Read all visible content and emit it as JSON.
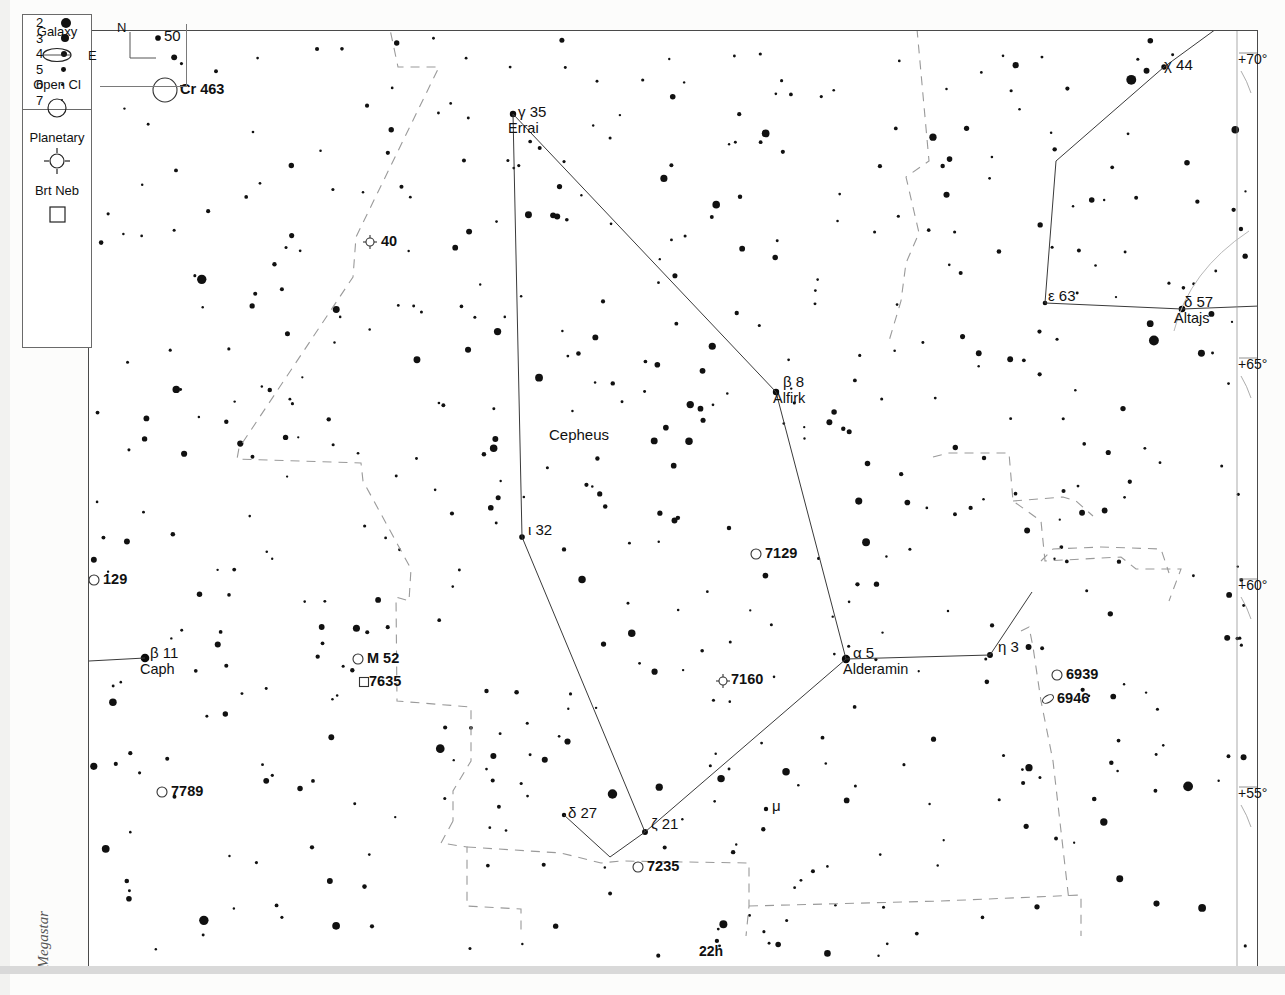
{
  "meta": {
    "watermark": "Megastar",
    "constellation_label": "Cepheus"
  },
  "legend": {
    "magnitude_title": "magnitudes",
    "magnitudes": [
      {
        "mag": "2",
        "r": 5.0
      },
      {
        "mag": "3",
        "r": 4.2
      },
      {
        "mag": "4",
        "r": 3.2
      },
      {
        "mag": "5",
        "r": 2.4
      },
      {
        "mag": "6",
        "r": 1.7
      },
      {
        "mag": "7",
        "r": 1.2
      }
    ],
    "symbols": [
      {
        "label": "Galaxy",
        "icon": "galaxy-ellipse-icon"
      },
      {
        "label": "Open Cl",
        "icon": "open-cluster-circle-icon"
      },
      {
        "label": "Planetary",
        "icon": "planetary-nebula-icon"
      },
      {
        "label": "Brt Neb",
        "icon": "bright-nebula-square-icon"
      }
    ]
  },
  "compass": {
    "north": "N",
    "east": "E"
  },
  "axes": {
    "declination": [
      {
        "label": "+70°",
        "x": 1238,
        "y": 52
      },
      {
        "label": "+65°",
        "x": 1238,
        "y": 357
      },
      {
        "label": "+60°",
        "x": 1238,
        "y": 578
      },
      {
        "label": "+55°",
        "x": 1238,
        "y": 786
      }
    ],
    "right_ascension": [
      {
        "label": "22h",
        "x": 699,
        "y": 944
      }
    ]
  },
  "star_labels": [
    {
      "name": "50",
      "greek": "",
      "num": "50",
      "proper": "",
      "x": 164,
      "y": 28,
      "anchor": "left"
    },
    {
      "name": "gamma-35",
      "greek": "γ",
      "num": "35",
      "proper": "Errai",
      "x": 518,
      "y": 104,
      "anchor": "left"
    },
    {
      "name": "chi-44",
      "greek": "χ",
      "num": "44",
      "proper": "",
      "x": 1164,
      "y": 57,
      "anchor": "left"
    },
    {
      "name": "epsilon-63",
      "greek": "ε",
      "num": "63",
      "proper": "",
      "x": 1048,
      "y": 288,
      "anchor": "left"
    },
    {
      "name": "delta-57",
      "greek": "δ",
      "num": "57",
      "proper": "Altajs",
      "x": 1184,
      "y": 294,
      "anchor": "left"
    },
    {
      "name": "beta-8",
      "greek": "β",
      "num": "8",
      "proper": "Alfirk",
      "x": 783,
      "y": 374,
      "anchor": "left"
    },
    {
      "name": "iota-32",
      "greek": "ι",
      "num": "32",
      "proper": "",
      "x": 528,
      "y": 522,
      "anchor": "left"
    },
    {
      "name": "beta-11",
      "greek": "β",
      "num": "11",
      "proper": "Caph",
      "x": 150,
      "y": 645,
      "anchor": "left"
    },
    {
      "name": "alpha-5",
      "greek": "α",
      "num": "5",
      "proper": "Alderamin",
      "x": 853,
      "y": 645,
      "anchor": "left"
    },
    {
      "name": "eta-3",
      "greek": "η",
      "num": "3",
      "proper": "",
      "x": 998,
      "y": 639,
      "anchor": "left"
    },
    {
      "name": "delta-27",
      "greek": "δ",
      "num": "27",
      "proper": "",
      "x": 568,
      "y": 805,
      "anchor": "left"
    },
    {
      "name": "zeta-21",
      "greek": "ζ",
      "num": "21",
      "proper": "",
      "x": 651,
      "y": 816,
      "anchor": "left"
    },
    {
      "name": "mu",
      "greek": "μ",
      "num": "",
      "proper": "",
      "x": 772,
      "y": 798,
      "anchor": "left"
    }
  ],
  "deep_sky": [
    {
      "name": "Cr 463",
      "type": "open-cluster",
      "x": 164,
      "y": 89,
      "lx": 180,
      "ly": 82
    },
    {
      "name": "40",
      "type": "planetary",
      "x": 369,
      "y": 241,
      "lx": 381,
      "ly": 234
    },
    {
      "name": "7129",
      "type": "open-cluster",
      "x": 755,
      "y": 553,
      "lx": 765,
      "ly": 546
    },
    {
      "name": "129",
      "type": "open-cluster",
      "x": 93,
      "y": 579,
      "lx": 103,
      "ly": 572
    },
    {
      "name": "M 52",
      "type": "open-cluster",
      "x": 357,
      "y": 658,
      "lx": 367,
      "ly": 651
    },
    {
      "name": "7635",
      "type": "bright-neb",
      "x": 363,
      "y": 681,
      "lx": 369,
      "ly": 674
    },
    {
      "name": "7160",
      "type": "planetary",
      "x": 722,
      "y": 680,
      "lx": 731,
      "ly": 672
    },
    {
      "name": "6939",
      "type": "open-cluster",
      "x": 1056,
      "y": 674,
      "lx": 1066,
      "ly": 667
    },
    {
      "name": "6946",
      "type": "galaxy",
      "x": 1047,
      "y": 698,
      "lx": 1057,
      "ly": 691
    },
    {
      "name": "7789",
      "type": "open-cluster",
      "x": 161,
      "y": 791,
      "lx": 171,
      "ly": 784
    },
    {
      "name": "7235",
      "type": "open-cluster",
      "x": 637,
      "y": 866,
      "lx": 647,
      "ly": 859
    }
  ],
  "chart_data": {
    "type": "scatter",
    "xlabel": "Right Ascension",
    "ylabel": "Declination",
    "projection": "equatorial",
    "grid": true,
    "legend_position": "left",
    "magnitude_scale": [
      2,
      3,
      4,
      5,
      6,
      7
    ],
    "named_stars": [
      {
        "id": "gamma-35",
        "bayer": "γ",
        "flamsteed": 35,
        "proper": "Errai",
        "px": 512,
        "py": 113,
        "mag": 3.2
      },
      {
        "id": "beta-8",
        "bayer": "β",
        "flamsteed": 8,
        "proper": "Alfirk",
        "px": 775,
        "py": 391,
        "mag": 3.2
      },
      {
        "id": "alpha-5",
        "bayer": "α",
        "flamsteed": 5,
        "proper": "Alderamin",
        "px": 845,
        "py": 658,
        "mag": 2.4
      },
      {
        "id": "eta-3",
        "bayer": "η",
        "flamsteed": 3,
        "proper": "",
        "px": 989,
        "py": 654,
        "mag": 3.4
      },
      {
        "id": "iota-32",
        "bayer": "ι",
        "flamsteed": 32,
        "proper": "",
        "px": 521,
        "py": 536,
        "mag": 3.5
      },
      {
        "id": "zeta-21",
        "bayer": "ζ",
        "flamsteed": 21,
        "proper": "",
        "px": 644,
        "py": 831,
        "mag": 3.4
      },
      {
        "id": "delta-27",
        "bayer": "δ",
        "flamsteed": 27,
        "proper": "",
        "px": 563,
        "py": 814,
        "mag": 4.0
      },
      {
        "id": "mu",
        "bayer": "μ",
        "flamsteed": 0,
        "proper": "",
        "px": 765,
        "py": 808,
        "mag": 4.1
      },
      {
        "id": "epsilon-63",
        "bayer": "ε",
        "flamsteed": 63,
        "proper": "",
        "px": 1044,
        "py": 302,
        "mag": 3.9
      },
      {
        "id": "delta-57",
        "bayer": "δ",
        "flamsteed": 57,
        "proper": "Altajs",
        "px": 1181,
        "py": 308,
        "mag": 3.1
      },
      {
        "id": "chi-44",
        "bayer": "χ",
        "flamsteed": 44,
        "proper": "",
        "px": 1163,
        "py": 66,
        "mag": 3.6
      },
      {
        "id": "beta-11",
        "bayer": "β",
        "flamsteed": 11,
        "proper": "Caph",
        "px": 144,
        "py": 657,
        "mag": 2.3
      },
      {
        "id": "50",
        "bayer": "",
        "flamsteed": 50,
        "proper": "",
        "px": 157,
        "py": 37,
        "mag": 3.5
      }
    ],
    "constellation_lines": [
      [
        [
          512,
          113
        ],
        [
          775,
          391
        ]
      ],
      [
        [
          512,
          113
        ],
        [
          521,
          536
        ]
      ],
      [
        [
          521,
          536
        ],
        [
          644,
          831
        ]
      ],
      [
        [
          644,
          831
        ],
        [
          845,
          658
        ]
      ],
      [
        [
          845,
          658
        ],
        [
          775,
          391
        ]
      ],
      [
        [
          845,
          658
        ],
        [
          989,
          654
        ]
      ],
      [
        [
          989,
          654
        ],
        [
          1031,
          591
        ]
      ],
      [
        [
          644,
          831
        ],
        [
          609,
          856
        ]
      ],
      [
        [
          609,
          856
        ],
        [
          563,
          814
        ]
      ],
      [
        [
          1044,
          302
        ],
        [
          1181,
          308
        ]
      ],
      [
        [
          1181,
          308
        ],
        [
          1285,
          304
        ]
      ],
      [
        [
          1044,
          302
        ],
        [
          1055,
          160
        ]
      ],
      [
        [
          1055,
          160
        ],
        [
          1163,
          66
        ]
      ],
      [
        [
          1163,
          66
        ],
        [
          1226,
          20
        ]
      ],
      [
        [
          144,
          657
        ],
        [
          88,
          660
        ]
      ]
    ]
  }
}
